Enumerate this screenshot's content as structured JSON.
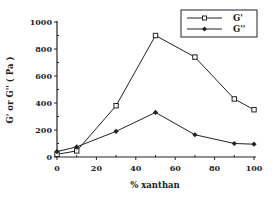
{
  "chart_data": {
    "type": "line",
    "title": "",
    "xlabel": "% xanthan",
    "ylabel": "G' or G'' ( Pa )",
    "x": [
      0,
      10,
      30,
      50,
      70,
      90,
      100
    ],
    "series": [
      {
        "name": "G'",
        "marker": "open-square",
        "values": [
          20,
          45,
          380,
          900,
          740,
          430,
          350
        ]
      },
      {
        "name": "G''",
        "marker": "filled-diamond",
        "values": [
          40,
          75,
          190,
          330,
          165,
          100,
          95
        ]
      }
    ],
    "xlim": [
      0,
      100
    ],
    "ylim": [
      0,
      1000
    ],
    "xticks": [
      0,
      20,
      40,
      60,
      80,
      100
    ],
    "yticks": [
      0,
      200,
      400,
      600,
      800,
      1000
    ],
    "grid": false,
    "legend_position": "upper right"
  },
  "colors": {
    "line": "#222222",
    "background": "#ffffff"
  }
}
